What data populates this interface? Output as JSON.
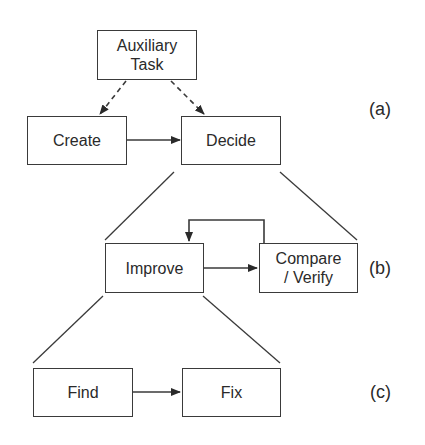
{
  "diagram": {
    "nodes": {
      "auxiliary": "Auxiliary\nTask",
      "create": "Create",
      "decide": "Decide",
      "improve": "Improve",
      "compare": "Compare\n/ Verify",
      "find": "Find",
      "fix": "Fix"
    },
    "levels": {
      "a": "(a)",
      "b": "(b)",
      "c": "(c)"
    },
    "edges": [
      {
        "from": "auxiliary",
        "to": "create",
        "style": "dashed"
      },
      {
        "from": "auxiliary",
        "to": "decide",
        "style": "dashed"
      },
      {
        "from": "create",
        "to": "decide",
        "style": "solid"
      },
      {
        "from": "improve",
        "to": "compare",
        "style": "solid"
      },
      {
        "from": "compare",
        "to": "improve",
        "style": "solid-loop"
      },
      {
        "from": "find",
        "to": "fix",
        "style": "solid"
      }
    ],
    "expansions": [
      {
        "parent": "decide",
        "children": [
          "improve",
          "compare"
        ]
      },
      {
        "parent": "improve",
        "children": [
          "find",
          "fix"
        ]
      }
    ]
  }
}
